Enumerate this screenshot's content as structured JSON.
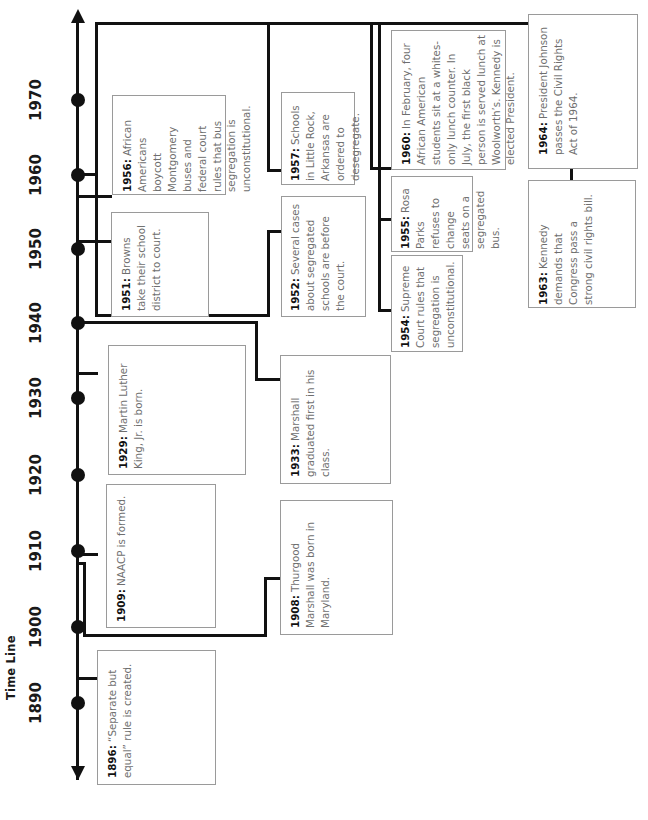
{
  "title": "Time Line",
  "axis": {
    "orientation": "vertical-rotated",
    "arrow_both_ends": true,
    "tick_labels": [
      "1970",
      "1960",
      "1950",
      "1940",
      "1930",
      "1920",
      "1910",
      "1900",
      "1890"
    ]
  },
  "colors": {
    "line": "#111111",
    "box_border": "#9a9a9a",
    "body_text": "#6e6e6e",
    "year_text": "#111111",
    "background": "#ffffff"
  },
  "events": [
    {
      "year": "1896:",
      "text": " “Separate but equal” rule is created."
    },
    {
      "year": "1908:",
      "text": " Thurgood Marshall was born in Maryland."
    },
    {
      "year": "1909:",
      "text": " NAACP is formed."
    },
    {
      "year": "1929:",
      "text": " Martin Luther King, Jr. is born."
    },
    {
      "year": "1933:",
      "text": " Marshall graduated first in his class."
    },
    {
      "year": "1951:",
      "text": " Browns take their school district to court."
    },
    {
      "year": "1952:",
      "text": " Several cases about segregated schools are before the court."
    },
    {
      "year": "1954:",
      "text": " Supreme Court rules that segregation is unconstitutional."
    },
    {
      "year": "1955:",
      "text": " Rosa Parks refuses to change seats on a segregated bus."
    },
    {
      "year": "1956:",
      "text": " African Americans boycott Montgomery buses and federal court rules that bus segregation is unconstitutional."
    },
    {
      "year": "1957:",
      "text": " Schools in Little Rock, Arkansas are ordered to desegregate."
    },
    {
      "year": "1960:",
      "text": " In February, four African American students sit at a whites-only lunch counter. In July, the first black person is served lunch at Woolworth’s. Kennedy is elected President."
    },
    {
      "year": "1963:",
      "text": " Kennedy demands that Congress pass a strong civil rights bill."
    },
    {
      "year": "1964:",
      "text": " President Johnson passes the Civil Rights Act of 1964."
    }
  ]
}
